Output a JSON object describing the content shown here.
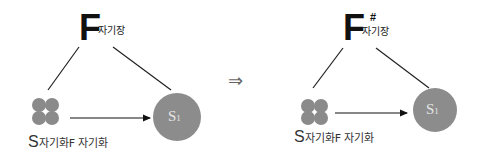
{
  "diagram": {
    "left": {
      "field_symbol": "F",
      "field_label": "자기장",
      "source_label_prefix": "S",
      "source_label_rest": "자기화F 자기화",
      "target_label": "S",
      "target_subscript": "1"
    },
    "implies_symbol": "⇒",
    "right": {
      "field_symbol": "F",
      "field_superscript": "#",
      "field_label": "자기장",
      "source_label_prefix": "S",
      "source_label_rest": "자기화F 자기화",
      "target_label": "S",
      "target_subscript": "1"
    },
    "colors": {
      "node_fill": "#8c8c8c",
      "line": "#222222",
      "text": "#111111"
    }
  }
}
